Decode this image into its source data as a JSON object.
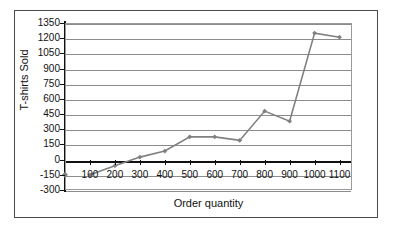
{
  "chart_data": {
    "type": "line",
    "title": "",
    "xlabel": "Order quantity",
    "ylabel": "T-shirts Sold",
    "xlim": [
      0,
      1150
    ],
    "ylim": [
      -300,
      1350
    ],
    "grid": true,
    "legend": false,
    "x_ticks": [
      100,
      200,
      300,
      400,
      500,
      600,
      700,
      800,
      900,
      1000,
      1100
    ],
    "x_tick_labels": [
      "100",
      "200",
      "300",
      "400",
      "500",
      "600",
      "700",
      "800",
      "900",
      "1000",
      "1100"
    ],
    "y_ticks": [
      -300,
      -150,
      0,
      150,
      300,
      450,
      600,
      750,
      900,
      1050,
      1200,
      1350
    ],
    "y_tick_labels": [
      "-300",
      "-150",
      "0",
      "150",
      "300",
      "450",
      "600",
      "750",
      "900",
      "1050",
      "1200",
      "1350"
    ],
    "series": [
      {
        "name": "T-shirts Sold",
        "color": "#808080",
        "marker": "diamond",
        "x": [
          100,
          200,
          300,
          400,
          500,
          600,
          700,
          800,
          900,
          1000,
          1100
        ],
        "values": [
          -150,
          -60,
          25,
          85,
          225,
          225,
          190,
          480,
          380,
          1250,
          1210
        ]
      }
    ],
    "extra_points": [
      {
        "name": "origin-marker",
        "x": 0,
        "y": -150,
        "color": "#808080"
      }
    ]
  },
  "axis": {
    "y_title": "T-shirts Sold",
    "x_title": "Order quantity"
  }
}
